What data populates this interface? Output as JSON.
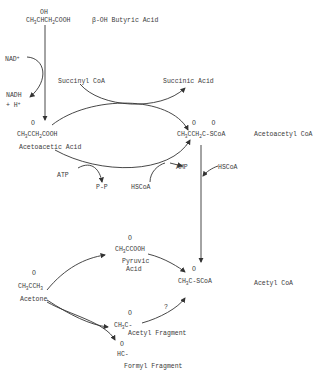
{
  "diagram": {
    "compounds": {
      "hydroxybutyric": {
        "formula_top": "OH",
        "formula": "CH3CHCH2COOH",
        "name": "β-OH Butyric Acid"
      },
      "acetoacetic": {
        "formula_top": "O",
        "formula": "CH3CCH2COOH",
        "name": "Acetoacetic Acid"
      },
      "acetoacetyl_coa": {
        "formula_top": "O     O",
        "formula": "CH3CCH2C-SCoA",
        "name": "Acetoacetyl CoA"
      },
      "acetone": {
        "formula_top": "O",
        "formula": "CH3CCH3",
        "name": "Acetone"
      },
      "pyruvic": {
        "formula_top": "O",
        "formula": "CH3CCOOH",
        "name_line1": "Pyruvic",
        "name_line2": "Acid"
      },
      "acetyl_coa": {
        "formula_top": "O",
        "formula": "CH3C-SCoA",
        "name": "Acetyl CoA"
      },
      "acetyl_fragment": {
        "formula_top": "O",
        "formula": "CH3C-",
        "name": "Acetyl Fragment"
      },
      "formyl_fragment": {
        "formula_top": "O",
        "formula": "HC-",
        "name": "Formyl Fragment"
      }
    },
    "cofactors": {
      "nad": "NAD",
      "nad_sup": "+",
      "nadh": "NADH",
      "h": "+ H",
      "h_sup": "+",
      "succinyl_coa": "Succinyl CoA",
      "succinic_acid": "Succinic Acid",
      "atp": "ATP",
      "ppi": "P-P",
      "hscoa1": "HSCoA",
      "amp": "AMP",
      "hscoa2": "HSCoA",
      "question": "?"
    }
  }
}
